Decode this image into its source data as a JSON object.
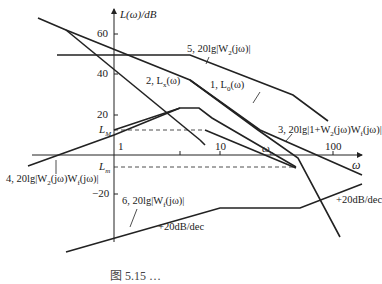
{
  "axes": {
    "y_label": "L(ω)/dB",
    "x_label": "ω",
    "y_ticks": [
      "60",
      "40",
      "20",
      "−20"
    ],
    "x_ticks": [
      "1",
      "10",
      "100"
    ],
    "omega_c": "ω",
    "omega_c_sub": "c",
    "L_M": "L",
    "L_M_sub": "M",
    "L_m": "L",
    "L_m_sub": "m"
  },
  "curves": [
    {
      "id": 1,
      "label": "1, L",
      "sub": "0",
      "suffix": "(ω)"
    },
    {
      "id": 2,
      "label": "2, L",
      "sub": "x",
      "suffix": "(ω)"
    },
    {
      "id": 3,
      "label": "3, 20lg|1+W",
      "sub": "2",
      "mid": "(jω)W",
      "sub2": "f",
      "suffix": "(jω)|"
    },
    {
      "id": 4,
      "label": "4, 20lg|W",
      "sub": "2",
      "mid": "(jω)W",
      "sub2": "f",
      "suffix": "(jω)|"
    },
    {
      "id": 5,
      "label": "5, 20lg|W",
      "sub": "2",
      "suffix": "(jω)|"
    },
    {
      "id": 6,
      "label": "6, 20lg|W",
      "sub": "f",
      "suffix": "(jω)|"
    }
  ],
  "annotations": {
    "slope_right": "+20dB/dec",
    "slope_bottom": "+20dB/dec"
  },
  "caption": "图 5.15 …"
}
